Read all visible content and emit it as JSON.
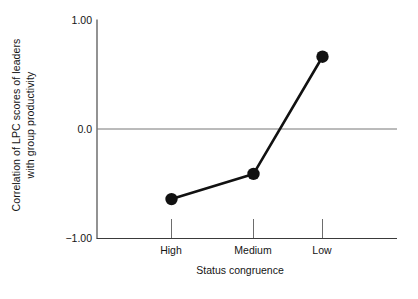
{
  "chart_data": {
    "type": "line",
    "title": "",
    "subtitle": "",
    "xlabel": "Status congruence",
    "ylabel_line1": "Correlation of LPC scores of leaders",
    "ylabel_line2": "with group productivity",
    "categories": [
      "High",
      "Medium",
      "Low"
    ],
    "values": [
      -0.64,
      -0.41,
      0.66
    ],
    "series": [
      {
        "name": "Correlation of LPC scores of leaders with group productivity",
        "values": [
          -0.64,
          -0.41,
          0.66
        ]
      }
    ],
    "ylim": [
      -1.0,
      1.0
    ],
    "ytick_labels": [
      "1.00",
      "0.0",
      "−1.00"
    ],
    "ytick_values": [
      1.0,
      0.0,
      -1.0
    ],
    "xtick_labels": [
      "High",
      "Medium",
      "Low"
    ],
    "grid": false,
    "zero_line": true,
    "legend": "none",
    "marker": "filled-circle",
    "line_color": "#111111",
    "marker_color": "#111111",
    "axis_color": "#3a3a3a",
    "zero_line_color": "#777777",
    "background_color": "#ffffff"
  },
  "axis": {
    "y_tick_top": "1.00",
    "y_tick_mid": "0.0",
    "y_tick_bottom": "−1.00",
    "x_tick_high": "High",
    "x_tick_medium": "Medium",
    "x_tick_low": "Low",
    "x_title": "Status congruence",
    "y_title_line1": "Correlation of LPC scores of leaders",
    "y_title_line2": "with group productivity"
  }
}
